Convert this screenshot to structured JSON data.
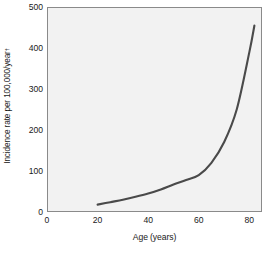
{
  "figure": {
    "background": "#ffffff",
    "plot_background": "#f2f2f2",
    "line_color": "#4a4a4a",
    "axis_color": "#808080"
  },
  "chart_data": {
    "type": "line",
    "title": "",
    "xlabel": "Age (years)",
    "ylabel": "Incidence rate per 100,000/year",
    "ylabel_superscript": "†",
    "xlim": [
      0,
      85
    ],
    "ylim": [
      0,
      500
    ],
    "grid": false,
    "legend": null,
    "xticks": [
      0,
      20,
      40,
      60,
      80
    ],
    "xtick_labels": [
      "0",
      "20",
      "40",
      "60",
      "80"
    ],
    "x_minor_ticks": [
      10,
      30,
      50,
      70
    ],
    "yticks": [
      0,
      100,
      200,
      300,
      400,
      500
    ],
    "ytick_labels": [
      "0",
      "100",
      "200",
      "300",
      "400",
      "500"
    ],
    "y_minor_ticks": [
      50,
      150,
      250,
      350,
      450
    ],
    "series": [
      {
        "name": "Incidence rate",
        "x": [
          20,
          25,
          30,
          35,
          40,
          45,
          50,
          55,
          60,
          65,
          70,
          75,
          80,
          82
        ],
        "values": [
          18,
          24,
          30,
          37,
          45,
          55,
          67,
          78,
          90,
          120,
          170,
          250,
          390,
          455
        ]
      }
    ]
  }
}
